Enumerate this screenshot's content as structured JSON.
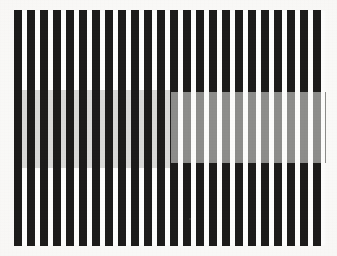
{
  "figure": {
    "kind": "brightness-contrast-illusion",
    "caption": "",
    "canvas": {
      "width": 337,
      "height": 256
    },
    "background_color": "#f8f7f5"
  },
  "grating": {
    "name": "square-wave-vertical-grating",
    "orientation": "vertical",
    "bar_color": "#1d1c1b",
    "gap_color": "#fcfcfb",
    "period_px": 13,
    "bar_width_px": 7.6,
    "gap_width_px": 5.4,
    "bar_count": 24,
    "left_px": 14,
    "right_px": 326,
    "top_px": 10,
    "bottom_px": 246
  },
  "patches": [
    {
      "id": "left-test-patch",
      "label": "Left gray band (replaces light bars)",
      "phase": "on-light-bars",
      "fill_color": "#d9d9d7",
      "perceived": "lighter",
      "x": 14,
      "y": 90,
      "width": 157,
      "height": 78
    },
    {
      "id": "right-test-patch",
      "label": "Right gray band (replaces dark bars)",
      "phase": "on-dark-bars",
      "fill_color": "#8d8d8b",
      "perceived": "darker",
      "x": 171,
      "y": 92,
      "width": 155,
      "height": 71
    }
  ],
  "marks": [
    {
      "id": "scan-speck",
      "x": 189,
      "y": 218,
      "size": 2
    }
  ],
  "colors": {
    "ink_black": "#1d1c1b",
    "paper_white": "#fcfcfb",
    "gray_light": "#d9d9d7",
    "gray_dark": "#8d8d8b",
    "page_background": "#f8f7f5"
  }
}
